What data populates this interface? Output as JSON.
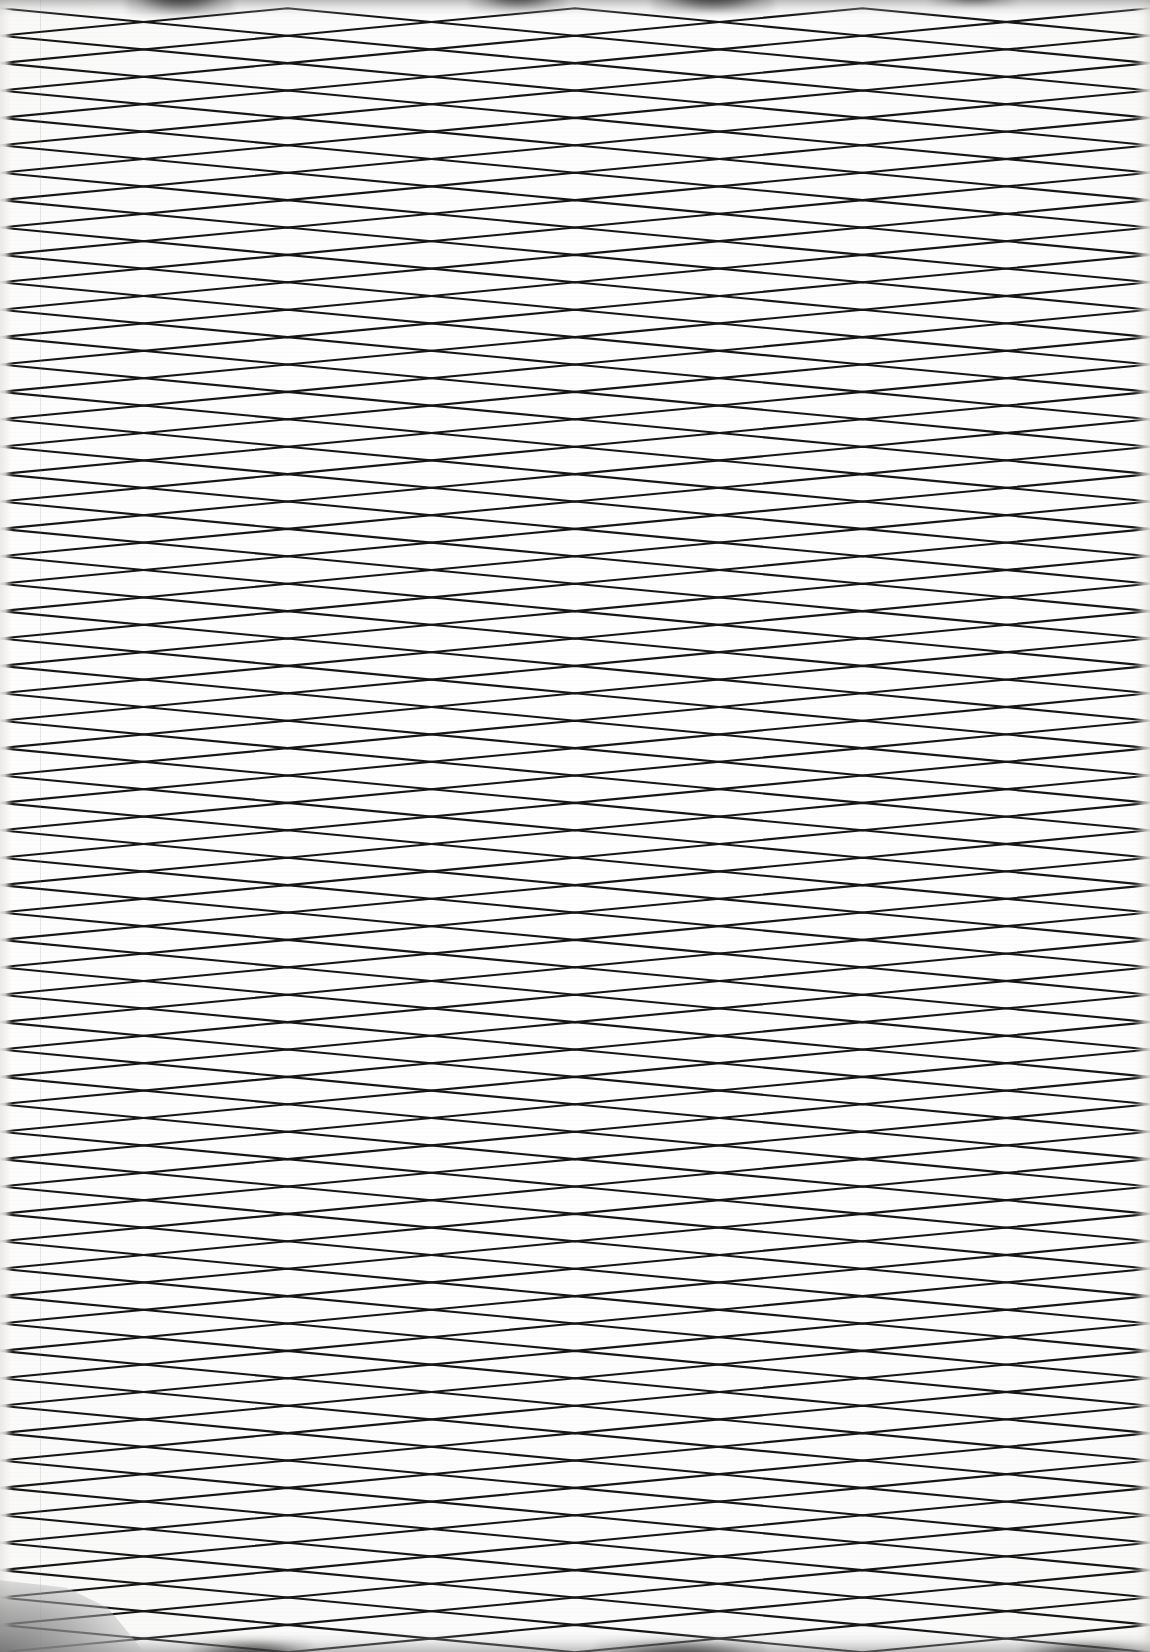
{
  "document": {
    "kind": "photographed-sheet",
    "caption": "",
    "page_width_px": 1150,
    "page_height_px": 1652
  },
  "colors": {
    "paper": "#fdfdfd",
    "paper_shadow": "#e6e5e2",
    "ink": "#151515",
    "ink_soft": "#2c2c2c",
    "edge_smudge": "#0e0e0e",
    "corner_shadow": "#747474",
    "margin_rule": "#787878"
  },
  "chart_data": {
    "type": "line",
    "title": "",
    "subtitle": "",
    "xlabel": "",
    "ylabel": "",
    "grid": false,
    "legend_position": "none",
    "xlim": [
      0,
      1150
    ],
    "ylim": [
      0,
      1652
    ],
    "description": "Continuous serpentine (boustrophedon) plotter trace drawn twice in opposite phase, producing a dense horizontal diamond lattice across the whole sheet.",
    "geometry": {
      "row_pitch_px": 27.4,
      "row_count": 60,
      "first_row_center_y_px": 22,
      "zigzag_half_period_px": 287.5,
      "zigzag_full_period_px": 575,
      "zigzag_amplitude_px": 13.7,
      "crossing_x_phase_a_px": [
        0,
        287.5,
        575,
        862.5,
        1150
      ],
      "crossing_x_phase_b_px": [
        143.75,
        431.25,
        718.75,
        1006.25
      ],
      "stroke_width_px": 2.1,
      "stroke_color": "#151515",
      "turnaround_edges": [
        "left",
        "right"
      ]
    },
    "series": [
      {
        "name": "serpentine-trace-phase-a",
        "phase_deg": 0,
        "values": []
      },
      {
        "name": "serpentine-trace-phase-b",
        "phase_deg": 180,
        "values": []
      }
    ],
    "annotations": []
  },
  "artifacts": {
    "top_smudges": 4,
    "bottom_smudges": 3,
    "left_edge_strip_px": 13,
    "right_edge_strip_px": 16,
    "corner_shadow": "bottom-left",
    "margin_rule_x_px": 40
  }
}
